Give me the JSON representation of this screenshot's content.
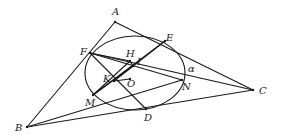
{
  "diagram": {
    "type": "geometry",
    "stroke_color": "#1a1a1a",
    "background": "#ffffff",
    "ellipse": {
      "name": "α",
      "cx": 135,
      "cy": 73,
      "rx": 50,
      "ry": 37
    },
    "points": {
      "A": {
        "label": "A",
        "x": 115,
        "y": 22,
        "lx": 112,
        "ly": 15
      },
      "B": {
        "label": "B",
        "x": 27,
        "y": 127,
        "lx": 15,
        "ly": 131
      },
      "C": {
        "label": "C",
        "x": 253,
        "y": 90,
        "lx": 259,
        "ly": 94
      },
      "D": {
        "label": "D",
        "x": 146,
        "y": 109,
        "lx": 144,
        "ly": 121
      },
      "E": {
        "label": "E",
        "x": 165,
        "y": 41,
        "lx": 166,
        "ly": 41
      },
      "F": {
        "label": "F",
        "x": 90,
        "y": 53,
        "lx": 80,
        "ly": 55
      },
      "H": {
        "label": "H",
        "x": 130,
        "y": 61,
        "lx": 126,
        "ly": 57
      },
      "I": {
        "label": "I",
        "x": 133,
        "y": 66,
        "lx": 137,
        "ly": 65
      },
      "K": {
        "label": "K",
        "x": 114,
        "y": 81,
        "lx": 103,
        "ly": 82
      },
      "O": {
        "label": "O",
        "x": 130,
        "y": 79,
        "lx": 127,
        "ly": 87
      },
      "M": {
        "label": "M",
        "x": 93,
        "y": 95,
        "lx": 85,
        "ly": 106
      },
      "N": {
        "label": "N",
        "x": 182,
        "y": 80,
        "lx": 182,
        "ly": 90
      }
    },
    "ellipse_label": {
      "text": "α",
      "x": 188,
      "y": 72
    },
    "segments": [
      [
        "A",
        "B"
      ],
      [
        "A",
        "C"
      ],
      [
        "B",
        "C"
      ],
      [
        "B",
        "N"
      ],
      [
        "F",
        "C"
      ],
      [
        "E",
        "M"
      ],
      [
        "F",
        "H"
      ],
      [
        "F",
        "N"
      ],
      [
        "E",
        "K"
      ],
      [
        "M",
        "H"
      ],
      [
        "M",
        "I"
      ],
      [
        "F",
        "D"
      ],
      [
        "H",
        "I"
      ],
      [
        "K",
        "O"
      ]
    ]
  }
}
